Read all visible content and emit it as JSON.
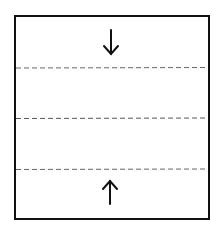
{
  "diagram": {
    "frame": {
      "x": 15,
      "y": 16,
      "width": 194,
      "height": 203,
      "stroke": "#111111"
    },
    "dashed_lines": [
      {
        "y": 68,
        "stroke": "#666666"
      },
      {
        "y": 118,
        "stroke": "#555555"
      },
      {
        "y": 169,
        "stroke": "#666666"
      }
    ],
    "arrows": [
      {
        "direction": "down",
        "x": 110,
        "y1": 32,
        "y2": 54
      },
      {
        "direction": "up",
        "x": 110,
        "y1": 204,
        "y2": 182
      }
    ]
  }
}
